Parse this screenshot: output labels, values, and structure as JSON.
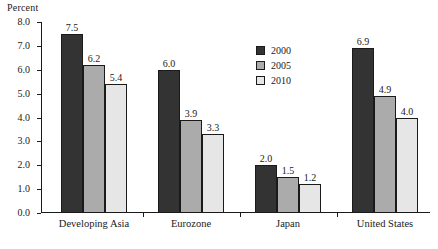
{
  "chart_data": {
    "type": "bar",
    "title": "",
    "xlabel": "",
    "ylabel": "Percent",
    "ylim": [
      0.0,
      8.0
    ],
    "ytick_step": 1.0,
    "yticks": [
      "0.0",
      "1.0",
      "2.0",
      "3.0",
      "4.0",
      "5.0",
      "6.0",
      "7.0",
      "8.0"
    ],
    "grid": false,
    "legend_position": "upper-center",
    "categories": [
      "Developing Asia",
      "Eurozone",
      "Japan",
      "United States"
    ],
    "series": [
      {
        "name": "2000",
        "color": "#333333",
        "values": [
          7.5,
          6.0,
          2.0,
          6.9
        ],
        "labels": [
          "7.5",
          "6.0",
          "2.0",
          "6.9"
        ]
      },
      {
        "name": "2005",
        "color": "#ababab",
        "values": [
          6.2,
          3.9,
          1.5,
          4.9
        ],
        "labels": [
          "6.2",
          "3.9",
          "1.5",
          "4.9"
        ]
      },
      {
        "name": "2010",
        "color": "#e6e6e6",
        "values": [
          5.4,
          3.3,
          1.2,
          4.0
        ],
        "labels": [
          "5.4",
          "3.3",
          "1.2",
          "4.0"
        ]
      }
    ]
  },
  "colors": {
    "axis": "#1a1a1a",
    "text": "#1a1a1a",
    "background": "#ffffff",
    "series_2000": "#333333",
    "series_2005": "#ababab",
    "series_2010": "#e6e6e6"
  }
}
